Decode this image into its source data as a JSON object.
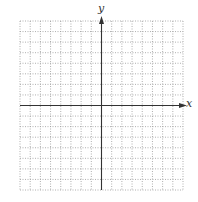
{
  "diagram": {
    "type": "coordinate-grid",
    "x_label": "x",
    "y_label": "y",
    "grid": {
      "columns": 16,
      "rows": 16,
      "left": 20,
      "top": 21,
      "right": 183,
      "bottom": 190,
      "line_style": "dotted",
      "line_color": "#9a9a9a"
    },
    "axes": {
      "origin_col": 8,
      "origin_row": 8,
      "color": "#333333",
      "arrows": [
        "positive-x",
        "positive-y"
      ]
    }
  }
}
